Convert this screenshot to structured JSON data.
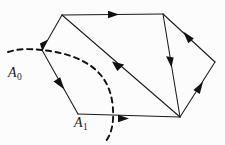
{
  "figure": {
    "background_color": "#fcfcfc",
    "line_color": "#1a1a1a",
    "dash_color": "#111111",
    "width": 225,
    "height": 145
  },
  "labels": [
    {
      "id": "A0",
      "base": "A",
      "subscript": "0",
      "x": 8,
      "y": 66
    },
    {
      "id": "A1",
      "base": "A",
      "subscript": "1",
      "x": 74,
      "y": 116
    }
  ],
  "vertices": {
    "top_left": {
      "x": 62,
      "y": 15
    },
    "top_right": {
      "x": 163,
      "y": 14
    },
    "left": {
      "x": 42,
      "y": 50
    },
    "right": {
      "x": 215,
      "y": 62
    },
    "bottom_left": {
      "x": 78,
      "y": 114
    },
    "bottom_right": {
      "x": 180,
      "y": 117
    }
  },
  "edges": [
    {
      "name": "top-edge",
      "from": "top_left",
      "to": "top_right",
      "arrow": "forward",
      "arrow_at": 0.5
    },
    {
      "name": "top-left-to-left-edge",
      "from": "top_left",
      "to": "left",
      "arrow": "forward",
      "arrow_at": 0.97
    },
    {
      "name": "left-to-bottom-left-edge",
      "from": "left",
      "to": "bottom_left",
      "arrow": "forward",
      "arrow_at": 0.52
    },
    {
      "name": "bottom-edge",
      "from": "bottom_left",
      "to": "bottom_right",
      "arrow": "forward",
      "arrow_at": 0.44
    },
    {
      "name": "diagonal-edge",
      "from": "bottom_right",
      "to": "top_left",
      "arrow": "forward",
      "arrow_at": 0.52
    },
    {
      "name": "top-right-to-bottom-right-edge",
      "from": "top_right",
      "to": "bottom_right",
      "arrow": "forward",
      "arrow_at": 0.45
    },
    {
      "name": "right-to-top-right-edge",
      "from": "right",
      "to": "top_right",
      "arrow": "forward",
      "arrow_at": 0.52
    },
    {
      "name": "bottom-right-to-right-edge",
      "from": "bottom_right",
      "to": "right",
      "arrow": "forward",
      "arrow_at": 0.52
    }
  ],
  "dashed_curves": [
    {
      "name": "curve-A0",
      "path": "M 8 52 C 20 48, 32 49, 42 50 C 62 52, 84 58, 98 72 C 110 84, 114 101, 113 120 C 112 131, 109 137, 106 141"
    }
  ]
}
